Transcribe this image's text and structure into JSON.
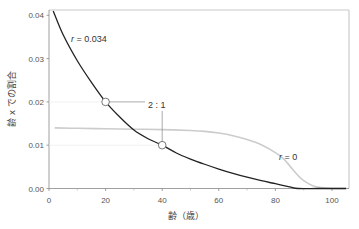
{
  "chart_data": {
    "type": "line",
    "title": "",
    "xlabel": "齢（歳）",
    "ylabel": "齢 x での割合",
    "xlim": [
      0,
      105
    ],
    "ylim": [
      0,
      0.041
    ],
    "x_ticks": [
      0,
      20,
      40,
      60,
      80,
      100
    ],
    "x_tick_labels": [
      "0",
      "20",
      "40",
      "60",
      "80",
      "100"
    ],
    "x_minor_ticks": [
      10,
      30,
      50,
      70,
      90
    ],
    "y_ticks": [
      0,
      0.01,
      0.02,
      0.03,
      0.04
    ],
    "y_tick_labels": [
      "0.00",
      "0.01",
      "0.02",
      "0.03",
      "0.04"
    ],
    "grid": false,
    "series": [
      {
        "name": "r = 0.034",
        "color": "#222222",
        "x": [
          1.5,
          5,
          10,
          15,
          20,
          25,
          30,
          35,
          40,
          45,
          50,
          55,
          60,
          65,
          70,
          75,
          80,
          85,
          88,
          95,
          105
        ],
        "y": [
          0.041,
          0.0355,
          0.0295,
          0.0245,
          0.02,
          0.0165,
          0.0135,
          0.0115,
          0.01,
          0.0082,
          0.0068,
          0.0056,
          0.0045,
          0.0035,
          0.0026,
          0.0018,
          0.0011,
          0.0004,
          0.0,
          0.0,
          0.0
        ]
      },
      {
        "name": "r = 0",
        "color": "#cccccc",
        "x": [
          2,
          10,
          20,
          30,
          40,
          50,
          55,
          60,
          65,
          70,
          75,
          80,
          83,
          86,
          88,
          90,
          93,
          96,
          100,
          105
        ],
        "y": [
          0.014,
          0.0139,
          0.0138,
          0.0137,
          0.0136,
          0.0134,
          0.0132,
          0.0128,
          0.0122,
          0.0113,
          0.0101,
          0.0083,
          0.0068,
          0.0045,
          0.003,
          0.0018,
          0.0007,
          0.0002,
          0.0,
          0.0
        ]
      }
    ],
    "annotations": [
      {
        "text": "r = 0.034",
        "x": 10,
        "y": 0.034
      },
      {
        "text": "r = 0",
        "x": 82,
        "y": 0.0072
      },
      {
        "text": "2 : 1",
        "x": 40,
        "y": 0.0195,
        "points": [
          [
            20,
            0.02
          ],
          [
            40,
            0.01
          ]
        ]
      }
    ],
    "markers": [
      {
        "x": 20,
        "y": 0.02,
        "shape": "open-circle"
      },
      {
        "x": 40,
        "y": 0.01,
        "shape": "open-circle"
      }
    ]
  },
  "labels": {
    "r034_italic": "r",
    "r034_rest": " = 0.034",
    "r0_italic": "r",
    "r0_rest": " = 0",
    "ratio": "2 : 1",
    "xlabel": "齢（歳）",
    "ylabel": "齢 x での割合"
  }
}
